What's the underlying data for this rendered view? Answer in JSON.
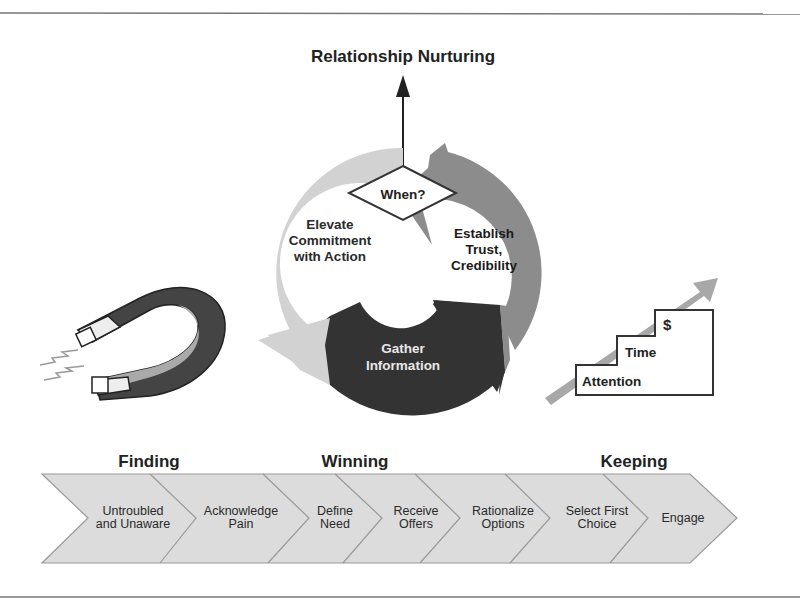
{
  "title": "Relationship Nurturing",
  "cycle": {
    "decision": "When?",
    "segments": [
      {
        "label_lines": [
          "Elevate",
          "Commitment",
          "with Action"
        ],
        "color": "#d2d2d2",
        "text_color": "#2a2a2a"
      },
      {
        "label_lines": [
          "Establish",
          "Trust,",
          "Credibility"
        ],
        "color": "#8c8c8c",
        "text_color": "#1a1a1a"
      },
      {
        "label_lines": [
          "Gather",
          "Information"
        ],
        "color": "#333333",
        "text_color": "#e8e8e8"
      }
    ]
  },
  "magnet": {
    "icon": "magnet-icon"
  },
  "stairs": {
    "icon": "stairs-arrow-icon",
    "steps": [
      "Attention",
      "Time",
      "$"
    ]
  },
  "stages": [
    "Finding",
    "Winning",
    "Keeping"
  ],
  "process_steps": [
    {
      "lines": [
        "Untroubled",
        "and Unaware"
      ]
    },
    {
      "lines": [
        "Acknowledge",
        "Pain"
      ]
    },
    {
      "lines": [
        "Define",
        "Need"
      ]
    },
    {
      "lines": [
        "Receive",
        "Offers"
      ]
    },
    {
      "lines": [
        "Rationalize",
        "Options"
      ]
    },
    {
      "lines": [
        "Select First",
        "Choice"
      ]
    },
    {
      "lines": [
        "Engage"
      ]
    }
  ],
  "colors": {
    "chevron_fill": "#dcdcdc",
    "chevron_stroke": "#9a9a9a",
    "rule": "#777777"
  }
}
